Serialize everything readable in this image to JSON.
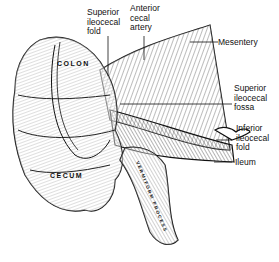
{
  "diagram": {
    "type": "anatomical-illustration",
    "organ_labels": {
      "colon": "COLON",
      "cecum": "CECUM",
      "appendix": "VERMIFORM PROCESS"
    },
    "callouts": [
      {
        "id": "superior-ileocecal-fold",
        "lines": [
          "Superior",
          "ileocecal",
          "fold"
        ]
      },
      {
        "id": "anterior-cecal-artery",
        "lines": [
          "Anterior",
          "cecal",
          "artery"
        ]
      },
      {
        "id": "mesentery",
        "lines": [
          "Mesentery"
        ]
      },
      {
        "id": "superior-ileocecal-fossa",
        "lines": [
          "Superior",
          "ileocecal",
          "fossa"
        ]
      },
      {
        "id": "inferior-ileocecal-fold",
        "lines": [
          "Inferior",
          "ileocecal",
          "fold"
        ]
      },
      {
        "id": "ileum",
        "lines": [
          "Ileum"
        ]
      }
    ]
  }
}
